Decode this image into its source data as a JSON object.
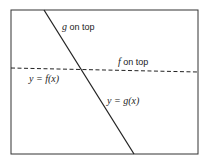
{
  "diagram": {
    "labels": {
      "g_on_top_var": "g",
      "g_on_top_text": " on top",
      "f_on_top_var": "f",
      "f_on_top_text": " on top",
      "f_curve": "y = f(x)",
      "g_curve": "y = g(x)"
    },
    "lines": {
      "f": {
        "style": "dashed",
        "from": [
          11,
          68
        ],
        "to": [
          198,
          72
        ]
      },
      "g": {
        "style": "solid",
        "from": [
          44,
          10
        ],
        "to": [
          134,
          154
        ]
      }
    },
    "colors": {
      "line": "#222222",
      "frame": "#333333"
    }
  }
}
